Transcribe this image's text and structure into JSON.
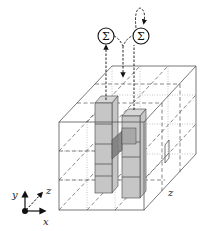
{
  "figure": {
    "summation_nodes": [
      {
        "label": "Σ",
        "position": "left"
      },
      {
        "label": "Σ",
        "position": "right"
      }
    ],
    "axes": {
      "x_label": "x",
      "y_label": "y",
      "z_label": "z"
    },
    "side_label": "z",
    "colors": {
      "cell_fill": "#c6c6c6",
      "cell_dark": "#7a7a7a",
      "edge": "#555555",
      "arrow": "#111111"
    }
  }
}
